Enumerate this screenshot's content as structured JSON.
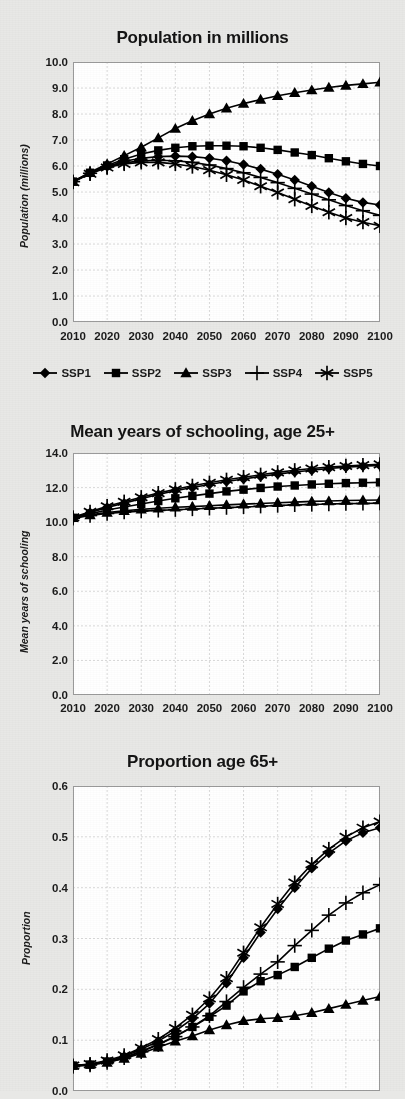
{
  "figure": {
    "background": "#e8e8e6",
    "plot_background": "#ffffff",
    "line_color": "#000000"
  },
  "legend": {
    "position": "below-panel-1",
    "items": [
      {
        "label": "SSP1",
        "marker": "diamond"
      },
      {
        "label": "SSP2",
        "marker": "square"
      },
      {
        "label": "SSP3",
        "marker": "triangle"
      },
      {
        "label": "SSP4",
        "marker": "plus"
      },
      {
        "label": "SSP5",
        "marker": "asterisk"
      }
    ]
  },
  "chart_data": [
    {
      "type": "line",
      "title": "Population in millions",
      "xlabel": "",
      "ylabel": "Population (millions)",
      "xlim": [
        2010,
        2100
      ],
      "ylim": [
        0.0,
        10.0
      ],
      "yticks": [
        "0.0",
        "1.0",
        "2.0",
        "3.0",
        "4.0",
        "5.0",
        "6.0",
        "7.0",
        "8.0",
        "9.0",
        "10.0"
      ],
      "xticks": [
        "2010",
        "2020",
        "2030",
        "2040",
        "2050",
        "2060",
        "2070",
        "2080",
        "2090",
        "2100"
      ],
      "grid": true,
      "legend": "below",
      "x": [
        2010,
        2015,
        2020,
        2025,
        2030,
        2035,
        2040,
        2045,
        2050,
        2055,
        2060,
        2065,
        2070,
        2075,
        2080,
        2085,
        2090,
        2095,
        2100
      ],
      "series": [
        {
          "name": "SSP1",
          "marker": "diamond",
          "values": [
            5.4,
            5.72,
            5.98,
            6.18,
            6.3,
            6.36,
            6.38,
            6.36,
            6.3,
            6.2,
            6.06,
            5.88,
            5.68,
            5.46,
            5.22,
            4.98,
            4.76,
            4.6,
            4.5
          ]
        },
        {
          "name": "SSP2",
          "marker": "square",
          "values": [
            5.4,
            5.74,
            6.02,
            6.26,
            6.46,
            6.6,
            6.7,
            6.76,
            6.78,
            6.78,
            6.76,
            6.7,
            6.62,
            6.52,
            6.42,
            6.3,
            6.18,
            6.08,
            6.0
          ]
        },
        {
          "name": "SSP3",
          "marker": "triangle",
          "values": [
            5.4,
            5.76,
            6.08,
            6.4,
            6.72,
            7.08,
            7.44,
            7.74,
            8.0,
            8.22,
            8.4,
            8.56,
            8.7,
            8.82,
            8.92,
            9.02,
            9.1,
            9.16,
            9.22
          ]
        },
        {
          "name": "SSP4",
          "marker": "plus",
          "values": [
            5.4,
            5.72,
            5.96,
            6.12,
            6.2,
            6.22,
            6.2,
            6.14,
            6.04,
            5.9,
            5.74,
            5.56,
            5.36,
            5.14,
            4.92,
            4.7,
            4.48,
            4.28,
            4.1
          ]
        },
        {
          "name": "SSP5",
          "marker": "asterisk",
          "values": [
            5.38,
            5.7,
            5.94,
            6.08,
            6.14,
            6.14,
            6.08,
            5.98,
            5.84,
            5.66,
            5.46,
            5.22,
            4.98,
            4.72,
            4.46,
            4.22,
            4.0,
            3.84,
            3.7
          ]
        }
      ]
    },
    {
      "type": "line",
      "title": "Mean years of schooling, age 25+",
      "xlabel": "",
      "ylabel": "Mean years of schooling",
      "xlim": [
        2010,
        2100
      ],
      "ylim": [
        0.0,
        14.0
      ],
      "yticks": [
        "0.0",
        "2.0",
        "4.0",
        "6.0",
        "8.0",
        "10.0",
        "12.0",
        "14.0"
      ],
      "xticks": [
        "2010",
        "2020",
        "2030",
        "2040",
        "2050",
        "2060",
        "2070",
        "2080",
        "2090",
        "2100"
      ],
      "grid": true,
      "x": [
        2010,
        2015,
        2020,
        2025,
        2030,
        2035,
        2040,
        2045,
        2050,
        2055,
        2060,
        2065,
        2070,
        2075,
        2080,
        2085,
        2090,
        2095,
        2100
      ],
      "series": [
        {
          "name": "SSP1",
          "marker": "diamond",
          "values": [
            10.25,
            10.55,
            10.85,
            11.1,
            11.35,
            11.6,
            11.82,
            12.0,
            12.18,
            12.35,
            12.5,
            12.64,
            12.78,
            12.9,
            13.0,
            13.1,
            13.18,
            13.24,
            13.28
          ]
        },
        {
          "name": "SSP2",
          "marker": "square",
          "values": [
            10.25,
            10.48,
            10.7,
            10.88,
            11.05,
            11.22,
            11.38,
            11.52,
            11.65,
            11.78,
            11.88,
            11.98,
            12.06,
            12.12,
            12.18,
            12.22,
            12.26,
            12.28,
            12.3
          ]
        },
        {
          "name": "SSP3",
          "marker": "triangle",
          "values": [
            10.25,
            10.42,
            10.56,
            10.66,
            10.74,
            10.8,
            10.86,
            10.9,
            10.95,
            11.0,
            11.04,
            11.08,
            11.12,
            11.16,
            11.2,
            11.22,
            11.25,
            11.27,
            11.28
          ]
        },
        {
          "name": "SSP4",
          "marker": "plus",
          "values": [
            10.22,
            10.38,
            10.5,
            10.58,
            10.64,
            10.68,
            10.72,
            10.76,
            10.8,
            10.84,
            10.88,
            10.92,
            10.96,
            11.0,
            11.02,
            11.05,
            11.07,
            11.08,
            11.1
          ]
        },
        {
          "name": "SSP5",
          "marker": "asterisk",
          "values": [
            10.28,
            10.6,
            10.92,
            11.18,
            11.44,
            11.68,
            11.9,
            12.1,
            12.28,
            12.45,
            12.6,
            12.74,
            12.88,
            13.0,
            13.1,
            13.18,
            13.25,
            13.3,
            13.34
          ]
        }
      ]
    },
    {
      "type": "line",
      "title": "Proportion age 65+",
      "xlabel": "",
      "ylabel": "Proportion",
      "xlim": [
        2010,
        2100
      ],
      "ylim": [
        0.0,
        0.6
      ],
      "yticks": [
        "0.0",
        "0.1",
        "0.2",
        "0.3",
        "0.4",
        "0.5",
        "0.6"
      ],
      "xticks": [
        "2010",
        "2020",
        "2030",
        "2040",
        "2050",
        "2060",
        "2070",
        "2080",
        "2090",
        "2100"
      ],
      "grid": true,
      "x": [
        2010,
        2015,
        2020,
        2025,
        2030,
        2035,
        2040,
        2045,
        2050,
        2055,
        2060,
        2065,
        2070,
        2075,
        2080,
        2085,
        2090,
        2095,
        2100
      ],
      "series": [
        {
          "name": "SSP1",
          "marker": "diamond",
          "values": [
            0.05,
            0.052,
            0.058,
            0.068,
            0.082,
            0.098,
            0.118,
            0.142,
            0.172,
            0.212,
            0.262,
            0.312,
            0.358,
            0.4,
            0.438,
            0.468,
            0.492,
            0.508,
            0.518
          ]
        },
        {
          "name": "SSP2",
          "marker": "square",
          "values": [
            0.05,
            0.052,
            0.058,
            0.066,
            0.078,
            0.092,
            0.108,
            0.126,
            0.146,
            0.168,
            0.196,
            0.216,
            0.228,
            0.244,
            0.262,
            0.28,
            0.296,
            0.308,
            0.32
          ]
        },
        {
          "name": "SSP3",
          "marker": "triangle",
          "values": [
            0.05,
            0.052,
            0.056,
            0.064,
            0.074,
            0.086,
            0.098,
            0.108,
            0.12,
            0.13,
            0.138,
            0.142,
            0.144,
            0.148,
            0.154,
            0.162,
            0.17,
            0.178,
            0.186
          ]
        },
        {
          "name": "SSP4",
          "marker": "plus",
          "values": [
            0.048,
            0.051,
            0.056,
            0.065,
            0.077,
            0.091,
            0.107,
            0.126,
            0.148,
            0.176,
            0.204,
            0.23,
            0.254,
            0.286,
            0.316,
            0.346,
            0.37,
            0.39,
            0.406
          ]
        },
        {
          "name": "SSP5",
          "marker": "asterisk",
          "values": [
            0.05,
            0.053,
            0.06,
            0.07,
            0.085,
            0.102,
            0.124,
            0.15,
            0.182,
            0.222,
            0.272,
            0.322,
            0.368,
            0.41,
            0.446,
            0.476,
            0.5,
            0.518,
            0.53
          ]
        }
      ]
    }
  ]
}
